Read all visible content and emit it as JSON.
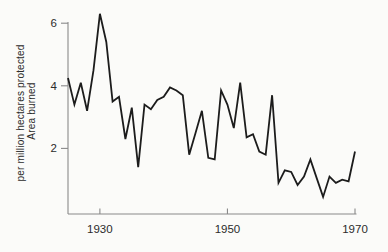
{
  "chart_data": {
    "type": "line",
    "title": "",
    "ylabel_line1": "Area burned",
    "ylabel_line2": "per million hectares protected",
    "xlabel": "",
    "x": [
      1925,
      1926,
      1927,
      1928,
      1929,
      1930,
      1931,
      1932,
      1933,
      1934,
      1935,
      1936,
      1937,
      1938,
      1939,
      1940,
      1941,
      1942,
      1943,
      1944,
      1945,
      1946,
      1947,
      1948,
      1949,
      1950,
      1951,
      1952,
      1953,
      1954,
      1955,
      1956,
      1957,
      1958,
      1959,
      1960,
      1961,
      1962,
      1963,
      1964,
      1965,
      1966,
      1967,
      1968,
      1969,
      1970
    ],
    "series": [
      {
        "name": "area-burned-per-million-hectares-protected",
        "values": [
          4.25,
          3.4,
          4.1,
          3.2,
          4.5,
          6.3,
          5.4,
          3.5,
          3.65,
          2.3,
          3.3,
          1.4,
          3.4,
          3.25,
          3.55,
          3.65,
          3.95,
          3.85,
          3.7,
          1.8,
          2.5,
          3.2,
          1.7,
          1.65,
          3.85,
          3.4,
          2.65,
          4.1,
          2.35,
          2.45,
          1.9,
          1.8,
          3.7,
          0.9,
          1.3,
          1.25,
          0.83,
          1.1,
          1.65,
          1.05,
          0.45,
          1.1,
          0.9,
          1.0,
          0.95,
          1.9
        ]
      }
    ],
    "x_ticks": [
      1930,
      1950,
      1970
    ],
    "y_ticks": [
      6,
      4,
      2
    ],
    "xlim": [
      1925,
      1970
    ],
    "ylim": [
      0,
      6.8
    ],
    "grid": false,
    "legend": "none",
    "line_color": "#1c1c1c",
    "axis_color": "#8a8a8a",
    "text_color": "#2b2b2b",
    "background": "#fbfbf9"
  }
}
